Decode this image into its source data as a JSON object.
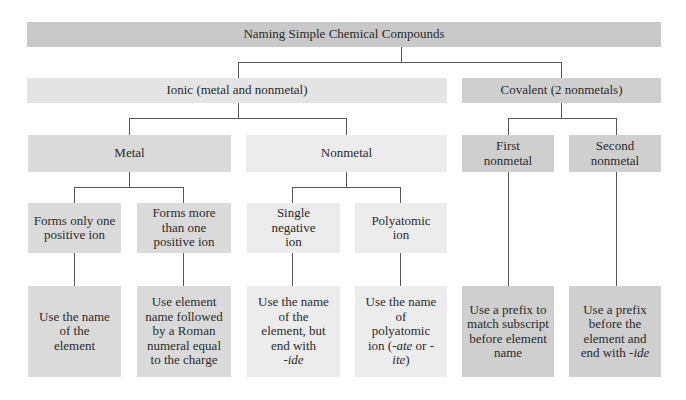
{
  "diagram": {
    "title": "Naming Simple Chemical Compounds",
    "ionic": {
      "label": "Ionic (metal and nonmetal)",
      "metal": {
        "label": "Metal",
        "children": [
          {
            "label": "Forms only one positive ion",
            "rule": "Use the name of the element"
          },
          {
            "label": "Forms more than one positive ion",
            "rule": "Use element name followed by a Roman numeral equal to the charge"
          }
        ]
      },
      "nonmetal": {
        "label": "Nonmetal",
        "children": [
          {
            "label": "Single negative ion",
            "rule_prefix": "Use the name of the element, but end with",
            "rule_suffix": "-ide"
          },
          {
            "label": "Polyatomic ion",
            "rule_prefix": "Use the name of polyatomic ion (",
            "rule_ate": "-ate",
            "rule_or": " or ",
            "rule_ite": "-ite",
            "rule_close": ")"
          }
        ]
      }
    },
    "covalent": {
      "label": "Covalent (2 nonmetals)",
      "children": [
        {
          "label": "First nonmetal",
          "rule": "Use a prefix to match subscript before element name"
        },
        {
          "label": "Second nonmetal",
          "rule_prefix": "Use a prefix before the element and end with",
          "rule_suffix": "-ide"
        }
      ]
    }
  },
  "colors": {
    "title": "#c9c9c9",
    "ionic": "#e4e4e4",
    "metal": "#dadada",
    "nonmetal": "#ececec",
    "covalent": "#cfcfcf",
    "connector": "#555555"
  }
}
